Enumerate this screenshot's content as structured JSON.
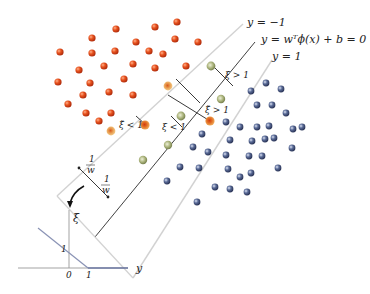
{
  "diagram": {
    "boundaries": {
      "negative_margin": "y = −1",
      "decision": "y = wᵀϕ(x) + b = 0",
      "positive_margin": "y = 1"
    },
    "slack_labels": {
      "xi_gt1_top": "ξ > 1",
      "xi_tilde_lt1": "ξ̃ < 1",
      "xi_lt1": "ξ < 1",
      "xi_tilde_gt1": "ξ̃ > 1"
    },
    "margin_labels": {
      "upper_num": "1",
      "upper_den": "w",
      "lower_num": "1",
      "lower_den": "w"
    },
    "hinge_plot": {
      "y_axis_label": "ξ",
      "x_axis_label": "y",
      "tick_y1": "1",
      "tick_x0": "0",
      "tick_x1": "1"
    },
    "colors": {
      "red_class": "#e0481e",
      "blue_class": "#4a5a86",
      "slack_green": "#9aa56a",
      "slack_orange": "#e58a2a",
      "margin_line": "#cfcfcf",
      "decision_line": "#222222",
      "hinge_line": "#8a93b5"
    }
  }
}
